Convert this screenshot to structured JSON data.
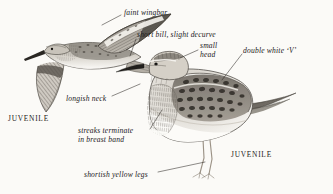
{
  "plate": {
    "title": "Juvenile sandpiper identification plate",
    "background_color": "#fbfaf7",
    "ink_color": "#23201c",
    "width": 333,
    "height": 194
  },
  "annotations": [
    {
      "id": "faint-wingbar",
      "text": "faint wingbar",
      "x": 124,
      "y": 8,
      "leader": [
        [
          121,
          15
        ],
        [
          102,
          25
        ]
      ]
    },
    {
      "id": "short-bill",
      "text": "short bill, slight decurve",
      "x": 137,
      "y": 30,
      "leader": [
        [
          136,
          39
        ],
        [
          130,
          56
        ]
      ]
    },
    {
      "id": "small-head",
      "text": "small\nhead",
      "x": 200,
      "y": 41,
      "leader": [
        [
          198,
          50
        ],
        [
          180,
          58
        ]
      ]
    },
    {
      "id": "double-white-v",
      "text": "double white ‘V’",
      "x": 243,
      "y": 46,
      "leader": [
        [
          242,
          54
        ],
        [
          222,
          80
        ]
      ]
    },
    {
      "id": "longish-neck",
      "text": "longish neck",
      "x": 66,
      "y": 94,
      "leader": [
        [
          112,
          96
        ],
        [
          140,
          84
        ]
      ]
    },
    {
      "id": "streaks-terminate",
      "text": "streaks terminate\nin breast band",
      "x": 78,
      "y": 126,
      "leader": [
        [
          150,
          129
        ],
        [
          162,
          110
        ]
      ]
    },
    {
      "id": "shortish-legs",
      "text": "shortish yellow legs",
      "x": 84,
      "y": 170,
      "leader": [
        [
          158,
          172
        ],
        [
          205,
          162
        ]
      ]
    }
  ],
  "captions": [
    {
      "id": "juvenile-flight",
      "text": "JUVENILE",
      "x": 8,
      "y": 114
    },
    {
      "id": "juvenile-standing",
      "text": "JUVENILE",
      "x": 231,
      "y": 150
    }
  ],
  "figures": [
    {
      "id": "flying-bird",
      "name": "sandpiper-in-flight",
      "pose": "flying, wings outstretched, upper left"
    },
    {
      "id": "standing-bird",
      "name": "sandpiper-standing",
      "pose": "standing, facing left, center right"
    }
  ]
}
